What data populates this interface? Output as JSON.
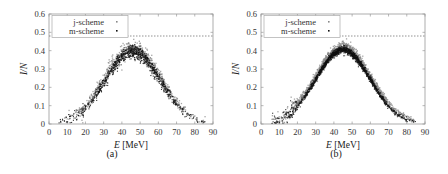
{
  "chart_data": [
    {
      "type": "scatter",
      "panel_label": "(a)",
      "xlabel": "E [MeV]",
      "xlabel_var": "E",
      "xlabel_unit": "[MeV]",
      "ylabel": "I/N",
      "xlim": [
        0,
        90
      ],
      "ylim": [
        0,
        0.6
      ],
      "xticks": [
        0,
        10,
        20,
        30,
        40,
        50,
        60,
        70,
        80,
        90
      ],
      "yticks": [
        0,
        0.1,
        0.2,
        0.3,
        0.4,
        0.5,
        0.6
      ],
      "reference_line": {
        "y": 0.48,
        "style": "dashed"
      },
      "legend": {
        "position": "upper left",
        "entries": [
          "j-scheme",
          "m-scheme"
        ]
      },
      "series": [
        {
          "name": "j-scheme",
          "color": "#888888",
          "peak_x": 46,
          "peak_y": 0.41,
          "width": 15.5,
          "spread": 0.022,
          "count": 700,
          "x_range": [
            5,
            86
          ]
        },
        {
          "name": "m-scheme",
          "color": "#111111",
          "peak_x": 46,
          "peak_y": 0.395,
          "width": 15.0,
          "spread": 0.018,
          "count": 900,
          "x_range": [
            5,
            86
          ]
        }
      ]
    },
    {
      "type": "scatter",
      "panel_label": "(b)",
      "xlabel": "E [MeV]",
      "xlabel_var": "E",
      "xlabel_unit": "[MeV]",
      "ylabel": "I/N",
      "xlim": [
        0,
        90
      ],
      "ylim": [
        0,
        0.6
      ],
      "xticks": [
        0,
        10,
        20,
        30,
        40,
        50,
        60,
        70,
        80,
        90
      ],
      "yticks": [
        0,
        0.1,
        0.2,
        0.3,
        0.4,
        0.5,
        0.6
      ],
      "reference_line": {
        "y": 0.48,
        "style": "dashed"
      },
      "legend": {
        "position": "upper left",
        "entries": [
          "j-scheme",
          "m-scheme"
        ]
      },
      "series": [
        {
          "name": "j-scheme",
          "color": "#888888",
          "peak_x": 45,
          "peak_y": 0.415,
          "width": 15.5,
          "spread": 0.014,
          "count": 1400,
          "x_range": [
            5,
            85
          ]
        },
        {
          "name": "m-scheme",
          "color": "#111111",
          "peak_x": 45,
          "peak_y": 0.405,
          "width": 14.8,
          "spread": 0.009,
          "count": 1400,
          "x_range": [
            5,
            85
          ]
        }
      ]
    }
  ],
  "captions": {
    "a": "(a)",
    "b": "(b)"
  }
}
